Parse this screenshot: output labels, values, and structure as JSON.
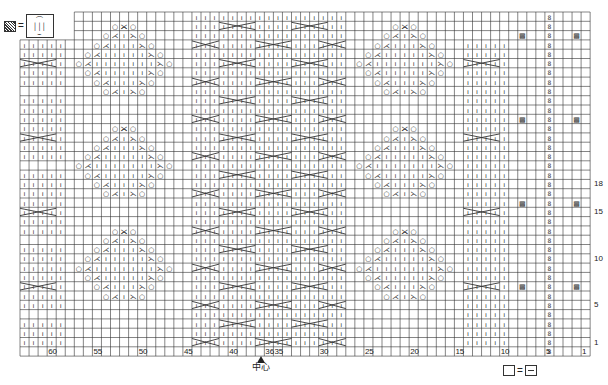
{
  "legend": {
    "cross_symbol": "cable-cross",
    "equals": "=",
    "cross_box_lines": [
      "⌒",
      "│││",
      "⌣"
    ],
    "blank_equals_purl": "□=⊟"
  },
  "center_label": "中心",
  "grid": {
    "left": 20,
    "top": 12,
    "cell_w": 9.05,
    "cell_h": 9.3,
    "cols": 63,
    "rows": 37,
    "top_offset_cols": 6,
    "left_block_start_row": 3,
    "line_color": "#333333"
  },
  "column_labels": [
    {
      "label": "60",
      "col": 3
    },
    {
      "label": "55",
      "col": 8
    },
    {
      "label": "50",
      "col": 13
    },
    {
      "label": "45",
      "col": 18
    },
    {
      "label": "40",
      "col": 23
    },
    {
      "label": "36",
      "col": 27
    },
    {
      "label": "35",
      "col": 28
    },
    {
      "label": "30",
      "col": 33
    },
    {
      "label": "25",
      "col": 38
    },
    {
      "label": "20",
      "col": 43
    },
    {
      "label": "15",
      "col": 48
    },
    {
      "label": "10",
      "col": 53
    },
    {
      "label": "5",
      "col": 58
    },
    {
      "label": "1",
      "col": 62
    }
  ],
  "row_labels": [
    {
      "label": "18",
      "row": 18
    },
    {
      "label": "15",
      "row": 21
    },
    {
      "label": "10",
      "row": 26
    },
    {
      "label": "5",
      "row": 31
    },
    {
      "label": "1",
      "row": 35
    }
  ],
  "symbols": {
    "I": "knit",
    "O": "yarn-over",
    "A": "k2tog-left",
    "Z": "k2tog-right",
    "X": "cable-cross",
    "T": "twisted-stitch",
    "M": "bobble",
    ".": "blank"
  }
}
